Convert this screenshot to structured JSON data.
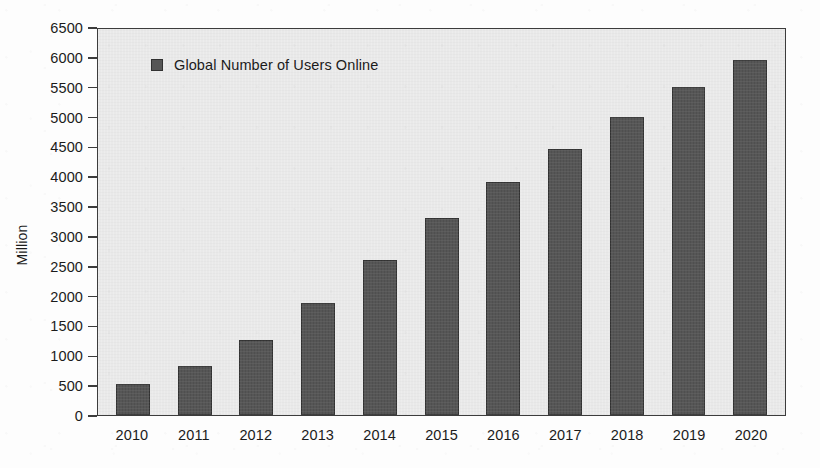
{
  "chart_data": {
    "type": "bar",
    "title": "",
    "subtitle": "",
    "xlabel": "",
    "ylabel": "Million",
    "categories": [
      "2010",
      "2011",
      "2012",
      "2013",
      "2014",
      "2015",
      "2016",
      "2017",
      "2018",
      "2019",
      "2020"
    ],
    "values": [
      525,
      825,
      1250,
      1875,
      2600,
      3300,
      3900,
      4450,
      5000,
      5500,
      5950
    ],
    "series": [
      {
        "name": "Global Number of Users Online",
        "values": [
          525,
          825,
          1250,
          1875,
          2600,
          3300,
          3900,
          4450,
          5000,
          5500,
          5950
        ]
      }
    ],
    "ylim": [
      0,
      6500
    ],
    "ytick_values": [
      0,
      500,
      1000,
      1500,
      2000,
      2500,
      3000,
      3500,
      4000,
      4500,
      5000,
      5500,
      6000,
      6500
    ],
    "ytick_labels": [
      "0",
      "500",
      "1000",
      "1500",
      "2000",
      "2500",
      "3000",
      "3500",
      "4000",
      "4500",
      "5000",
      "5500",
      "6000",
      "6500"
    ],
    "grid": false,
    "legend": {
      "position": "inside-top-left",
      "entries": [
        {
          "label": "Global Number of Users Online",
          "color": "#565656",
          "marker": "square"
        }
      ]
    },
    "colors": {
      "bar": "#565656",
      "plot_background": "#e9e9e9",
      "page_background": "#fdfdfd",
      "axis": "#3c3c3c",
      "text": "#1b1b1b"
    }
  }
}
